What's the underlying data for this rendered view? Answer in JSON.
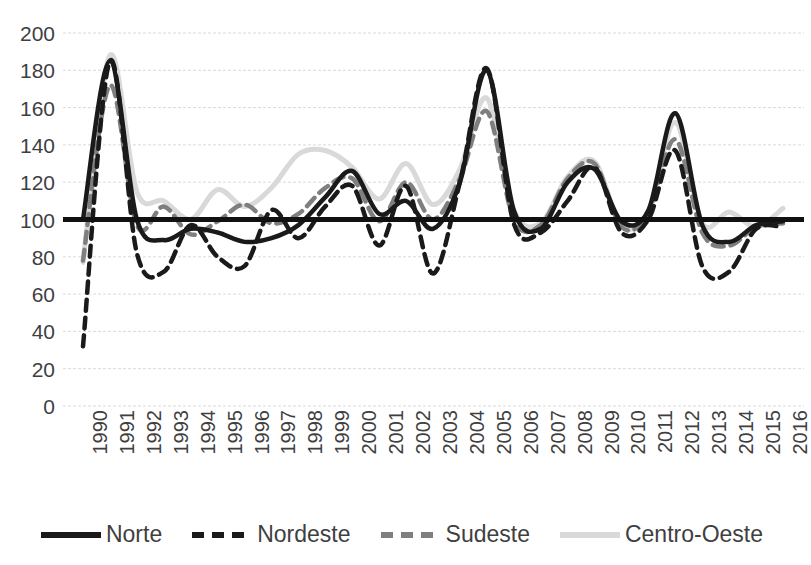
{
  "chart_data": {
    "type": "line",
    "title": "",
    "xlabel": "",
    "ylabel": "",
    "ylim": [
      0,
      200
    ],
    "ytick_step": 20,
    "grid": true,
    "legend_position": "bottom",
    "categories": [
      "1990",
      "1991",
      "1992",
      "1993",
      "1994",
      "1995",
      "1996",
      "1997",
      "1998",
      "1999",
      "2000",
      "2001",
      "2002",
      "2003",
      "2004",
      "2005",
      "2006",
      "2007",
      "2008",
      "2009",
      "2010",
      "2011",
      "2012",
      "2013",
      "2014",
      "2015",
      "2016"
    ],
    "yticks": [
      "0",
      "20",
      "40",
      "60",
      "80",
      "100",
      "120",
      "140",
      "160",
      "180",
      "200"
    ],
    "series": [
      {
        "name": "Norte",
        "color": "#1a1a1a",
        "style": "solid",
        "values": [
          100,
          185,
          100,
          89,
          95,
          93,
          88,
          90,
          97,
          112,
          126,
          103,
          110,
          95,
          120,
          180,
          105,
          95,
          120,
          127,
          99,
          105,
          157,
          97,
          88,
          97,
          99
        ]
      },
      {
        "name": "Nordeste",
        "color": "#1a1a1a",
        "style": "dashed",
        "values": [
          32,
          185,
          82,
          72,
          97,
          80,
          75,
          105,
          90,
          107,
          118,
          86,
          118,
          71,
          120,
          181,
          98,
          93,
          110,
          128,
          93,
          100,
          137,
          75,
          72,
          95,
          96
        ]
      },
      {
        "name": "Sudeste",
        "color": "#7f7f7f",
        "style": "dashed",
        "values": [
          78,
          172,
          97,
          107,
          92,
          99,
          108,
          98,
          103,
          117,
          122,
          99,
          120,
          100,
          122,
          158,
          100,
          97,
          122,
          130,
          96,
          103,
          143,
          93,
          86,
          96,
          98
        ]
      },
      {
        "name": "Centro-Oeste",
        "color": "#d9d9d9",
        "style": "solid",
        "values": [
          77,
          188,
          115,
          110,
          100,
          116,
          107,
          117,
          135,
          137,
          128,
          111,
          130,
          108,
          127,
          165,
          105,
          98,
          123,
          131,
          97,
          104,
          152,
          98,
          104,
          96,
          106
        ]
      }
    ]
  },
  "legend": {
    "items": [
      {
        "label": "Norte"
      },
      {
        "label": "Nordeste"
      },
      {
        "label": "Sudeste"
      },
      {
        "label": "Centro-Oeste"
      }
    ]
  }
}
